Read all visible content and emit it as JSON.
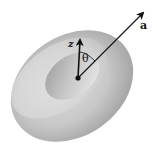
{
  "diagram": {
    "shape": "torus",
    "labels": {
      "z_axis": "z",
      "angle": "θ",
      "vector": "a"
    },
    "colors": {
      "background": "#ffffff",
      "torus_light": "#e4e4e4",
      "torus_mid": "#bdbdbd",
      "torus_dark": "#8e8e8e",
      "ink": "#111111"
    }
  }
}
